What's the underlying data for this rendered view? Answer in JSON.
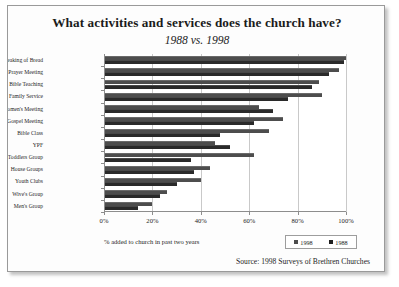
{
  "chart_data": {
    "type": "bar",
    "orientation": "horizontal",
    "title": "What activities and services does the church have?",
    "subtitle": "1988 vs. 1998",
    "xlabel": "% added to church in past two years",
    "ylabel": "",
    "xlim": [
      0,
      100
    ],
    "xticks": [
      "0%",
      "20%",
      "40%",
      "60%",
      "80%",
      "100%"
    ],
    "xtick_values": [
      0,
      20,
      40,
      60,
      80,
      100
    ],
    "grid": true,
    "legend_position": "bottom-right",
    "legend": [
      "1998",
      "1988"
    ],
    "categories": [
      "Breaking of Bread",
      "Prayer Meeting",
      "Bible Teaching",
      "Family Service",
      "Women's Meeting",
      "Gospel Meeting",
      "Bible Class",
      "YPF",
      "Mums and Toddlers Group",
      "House Groups",
      "Youth Clubs",
      "Wive's Group",
      "Men's Group"
    ],
    "series": [
      {
        "name": "1998",
        "values": [
          100,
          97,
          89,
          90,
          64,
          74,
          68,
          46,
          62,
          44,
          40,
          26,
          20
        ]
      },
      {
        "name": "1988",
        "values": [
          99,
          93,
          86,
          76,
          70,
          62,
          48,
          52,
          36,
          37,
          30,
          23,
          14
        ]
      }
    ],
    "source": "Source: 1998 Surveys of Brethren Churches",
    "colors": {
      "series_1998": "#4d4d4d",
      "series_1988": "#2a2a2a",
      "grid": "#c9c9c9",
      "axis": "#8d8d8d",
      "text": "#1d1d1d",
      "background": "#ffffff",
      "frame_border": "#9a9a9a"
    }
  }
}
